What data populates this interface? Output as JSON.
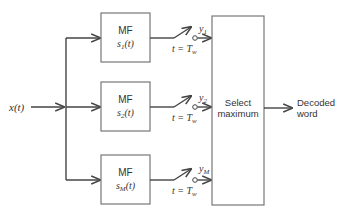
{
  "diagram": {
    "input": {
      "label": "x(t)"
    },
    "filters": [
      {
        "title": "MF",
        "signal": "s",
        "subscript": "1",
        "arg": "(t)",
        "output": "y",
        "output_sub": "1",
        "sample_time": "t = T",
        "sample_sub": "w"
      },
      {
        "title": "MF",
        "signal": "s",
        "subscript": "2",
        "arg": "(t)",
        "output": "y",
        "output_sub": "2",
        "sample_time": "t = T",
        "sample_sub": "w"
      },
      {
        "title": "MF",
        "signal": "s",
        "subscript": "M",
        "arg": "(t)",
        "output": "y",
        "output_sub": "M",
        "sample_time": "t = T",
        "sample_sub": "w"
      }
    ],
    "selector": {
      "line1": "Select",
      "line2": "maximum"
    },
    "output": {
      "line1": "Decoded",
      "line2": "word"
    }
  }
}
